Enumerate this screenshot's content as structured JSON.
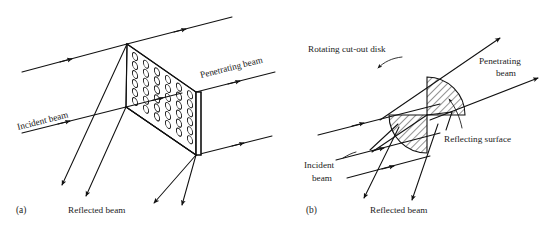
{
  "figure": {
    "caption_a": "(a)",
    "caption_b": "(b)",
    "panel_a": {
      "incident_label": "Incident beam",
      "penetrating_label": "Penetrating beam",
      "reflected_label": "Reflected beam",
      "device": "perforated-plate",
      "hole_rows": 9,
      "hole_cols": 6
    },
    "panel_b": {
      "disk_label": "Rotating cut-out disk",
      "penetrating_label_line1": "Penetrating",
      "penetrating_label_line2": "beam",
      "reflecting_label": "Reflecting surface",
      "incident_label_line1": "Incident",
      "incident_label_line2": "beam",
      "reflected_label": "Reflected beam",
      "device": "rotating-cutout-disk",
      "sectors": 2
    }
  },
  "style": {
    "ink": "#111111",
    "text": "#222222",
    "background": "#ffffff"
  }
}
